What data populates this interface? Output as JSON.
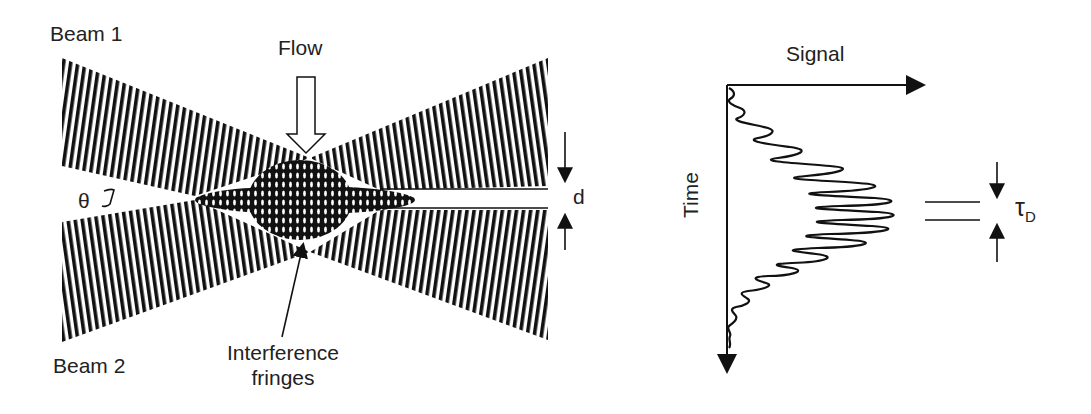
{
  "diagram": {
    "left_panel": {
      "labels": {
        "beam1": "Beam 1",
        "beam2": "Beam 2",
        "flow": "Flow",
        "theta": "θ",
        "fringe_spacing": "d",
        "interference_line1": "Interference",
        "interference_line2": "fringes"
      }
    },
    "right_panel": {
      "labels": {
        "x_axis": "Signal",
        "y_axis": "Time",
        "period_symbol": "τ",
        "period_subscript": "D"
      }
    },
    "colors": {
      "ink": "#1a1a1a",
      "background": "#ffffff"
    }
  }
}
